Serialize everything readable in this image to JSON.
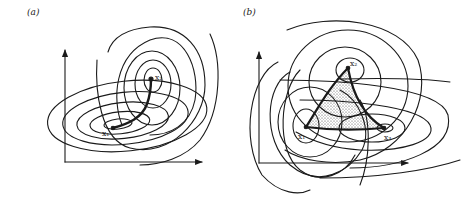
{
  "figure": {
    "panels": [
      {
        "id": "a",
        "label": "(a)",
        "description": "Two families of indifference contours centered at x1 and x2 with a thick curve joining the optima",
        "points": [
          {
            "name": "x1",
            "label": "x₁",
            "x": 113,
            "y": 128
          },
          {
            "name": "x2",
            "label": "x₂",
            "x": 151,
            "y": 79
          }
        ]
      },
      {
        "id": "b",
        "label": "(b)",
        "description": "Three families of contours centered at x1, x2, x3 with a shaded curvilinear triangle between the optima",
        "points": [
          {
            "name": "x1",
            "label": "x₁",
            "x": 306,
            "y": 127
          },
          {
            "name": "x2",
            "label": "x₂",
            "x": 348,
            "y": 68
          },
          {
            "name": "x3",
            "label": "x₃",
            "x": 384,
            "y": 128
          }
        ]
      }
    ],
    "colors": {
      "line": "#1a1a1a",
      "background": "#ffffff",
      "shading": "#555555"
    }
  }
}
